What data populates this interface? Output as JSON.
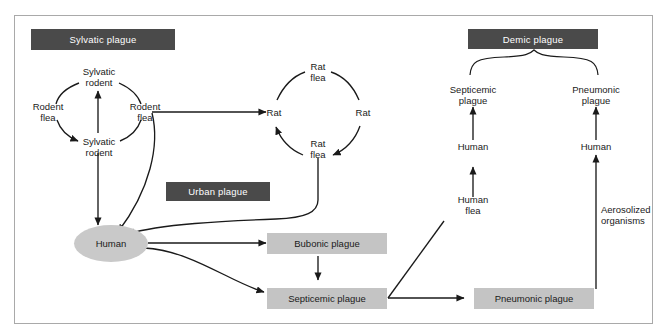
{
  "figure": {
    "border_color": "#a9a9a9",
    "header_color": "#4a4a4a",
    "box_color": "#c4c4c4",
    "ellipse_color": "#c9c9c9",
    "line_color": "#1a1a1a"
  },
  "headers": [
    {
      "id": "sylvatic",
      "label": "Sylvatic plague"
    },
    {
      "id": "urban",
      "label": "Urban plague"
    },
    {
      "id": "demic",
      "label": "Demic plague"
    }
  ],
  "sylvatic_cycle": {
    "top": "Sylvatic\nrodent",
    "right": "Rodent\nflea",
    "bottom": "Sylvatic\nrodent",
    "left": "Rodent\nflea"
  },
  "rat_cycle": {
    "top": "Rat\nflea",
    "right": "Rat",
    "bottom": "Rat\nflea",
    "left": "Rat"
  },
  "nodes": {
    "human_ellipse": "Human",
    "bubonic_box": "Bubonic plague",
    "septicemic_box": "Septicemic plague",
    "pneumonic_box": "Pneumonic plague",
    "septicemic_plague": "Septicemic\nplague",
    "pneumonic_plague": "Pneumonic\nplague",
    "human_left": "Human",
    "human_right": "Human",
    "human_flea": "Human\nflea",
    "aerosolized": "Aerosolized\norganisms"
  },
  "edges": [
    {
      "from": "Sylvatic rodent (bottom)",
      "to": "Sylvatic rodent (top)",
      "kind": "arrow-up"
    },
    {
      "from": "Sylvatic rodent (top)",
      "to": "Rodent flea (left)",
      "kind": "arc"
    },
    {
      "from": "Rodent flea (left)",
      "to": "Sylvatic rodent (bottom)",
      "kind": "arc-arrow"
    },
    {
      "from": "Sylvatic rodent (bottom)",
      "to": "Rodent flea (right)",
      "kind": "arc"
    },
    {
      "from": "Rodent flea (right)",
      "to": "Sylvatic rodent (top)",
      "kind": "arc"
    },
    {
      "from": "Rodent flea (right)",
      "to": "Rat (left)",
      "kind": "arrow-right"
    },
    {
      "from": "Rodent flea (right)",
      "to": "Human",
      "kind": "curve-arrow"
    },
    {
      "from": "Sylvatic rodent (bottom)",
      "to": "Human",
      "kind": "arrow-down"
    },
    {
      "from": "Rat (left)",
      "to": "Rat flea (top)",
      "kind": "arc"
    },
    {
      "from": "Rat flea (top)",
      "to": "Rat (right)",
      "kind": "arc"
    },
    {
      "from": "Rat (right)",
      "to": "Rat flea (bottom)",
      "kind": "arc-arrow"
    },
    {
      "from": "Rat flea (bottom)",
      "to": "Rat (left)",
      "kind": "arc-arrow"
    },
    {
      "from": "Rat flea (bottom)",
      "to": "Human",
      "kind": "curve-arrow"
    },
    {
      "from": "Human",
      "to": "Bubonic plague",
      "kind": "arrow-right"
    },
    {
      "from": "Human",
      "to": "Septicemic plague",
      "kind": "curve-arrow"
    },
    {
      "from": "Bubonic plague",
      "to": "Septicemic plague",
      "kind": "arrow-down"
    },
    {
      "from": "Septicemic plague",
      "to": "Human flea",
      "kind": "diagonal-arrow"
    },
    {
      "from": "Septicemic plague",
      "to": "Pneumonic plague",
      "kind": "arrow-right"
    },
    {
      "from": "Human flea",
      "to": "Human (left)",
      "kind": "arrow-up"
    },
    {
      "from": "Human (left)",
      "to": "Septicemic plague (demic)",
      "kind": "arrow-up"
    },
    {
      "from": "Pneumonic plague",
      "to": "Human (right)",
      "kind": "arrow-up",
      "label": "Aerosolized organisms"
    },
    {
      "from": "Human (right)",
      "to": "Pneumonic plague (demic)",
      "kind": "arrow-up"
    },
    {
      "from": "Demic plague",
      "to": "Septicemic & Pneumonic plague",
      "kind": "brace"
    }
  ]
}
